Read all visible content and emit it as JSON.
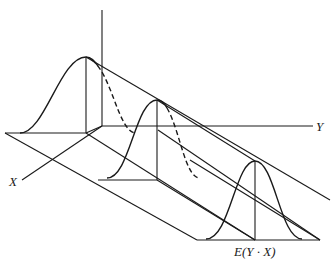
{
  "diagram": {
    "axes": {
      "x_label": "X",
      "y_label": "Y"
    },
    "regression_label": "E(Y · X)",
    "curves": [
      {
        "name": "back-normal-curve",
        "peak": [
          86,
          57
        ],
        "base_y": 132
      },
      {
        "name": "middle-normal-curve",
        "peak": [
          157,
          100
        ],
        "base_y": 176
      },
      {
        "name": "front-normal-curve",
        "peak": [
          255,
          161
        ],
        "base_y": 240
      }
    ],
    "colors": {
      "ink": "#1a1a1a",
      "background": "#ffffff"
    }
  }
}
